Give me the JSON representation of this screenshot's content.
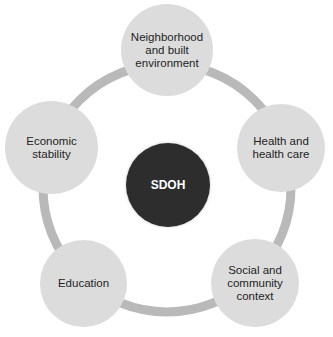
{
  "diagram": {
    "colors": {
      "ring": "#b9b9b9",
      "node_fill": "#dcdcdc",
      "center_fill": "#2d2d2d",
      "center_text": "#ffffff",
      "node_text": "#1e1e1e"
    },
    "center": {
      "label": "SDOH"
    },
    "nodes": [
      {
        "label": "Neighborhood and built environment"
      },
      {
        "label": "Health and health care"
      },
      {
        "label": "Social and community context"
      },
      {
        "label": "Education"
      },
      {
        "label": "Economic stability"
      }
    ]
  }
}
